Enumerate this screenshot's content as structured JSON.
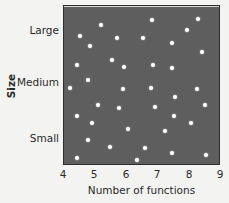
{
  "chart_data": {
    "type": "scatter",
    "title": "",
    "xlabel": "Number of functions",
    "ylabel": "Size",
    "xlim": [
      4,
      9
    ],
    "x_ticks": [
      "4",
      "5",
      "6",
      "7",
      "8",
      "9"
    ],
    "y_ticks": [
      "Small",
      "Medium",
      "Large"
    ],
    "y_axis_type": "categorical-ordinal",
    "grid": false,
    "legend": null,
    "colors": {
      "plot_background": "#5e5e5e",
      "points": "#ffffff",
      "page": "#f3f3f1"
    },
    "points": [
      {
        "x": 5.18,
        "y": 0.88
      },
      {
        "x": 6.8,
        "y": 0.91
      },
      {
        "x": 8.27,
        "y": 0.92
      },
      {
        "x": 4.51,
        "y": 0.81
      },
      {
        "x": 5.69,
        "y": 0.8
      },
      {
        "x": 6.52,
        "y": 0.8
      },
      {
        "x": 7.92,
        "y": 0.85
      },
      {
        "x": 4.83,
        "y": 0.75
      },
      {
        "x": 7.44,
        "y": 0.77
      },
      {
        "x": 8.39,
        "y": 0.71
      },
      {
        "x": 4.41,
        "y": 0.63
      },
      {
        "x": 5.53,
        "y": 0.66
      },
      {
        "x": 5.91,
        "y": 0.62
      },
      {
        "x": 6.83,
        "y": 0.63
      },
      {
        "x": 7.44,
        "y": 0.61
      },
      {
        "x": 4.76,
        "y": 0.54
      },
      {
        "x": 4.19,
        "y": 0.49
      },
      {
        "x": 5.88,
        "y": 0.48
      },
      {
        "x": 6.77,
        "y": 0.49
      },
      {
        "x": 8.24,
        "y": 0.48
      },
      {
        "x": 7.54,
        "y": 0.43
      },
      {
        "x": 5.08,
        "y": 0.38
      },
      {
        "x": 5.75,
        "y": 0.36
      },
      {
        "x": 6.9,
        "y": 0.37
      },
      {
        "x": 8.49,
        "y": 0.38
      },
      {
        "x": 4.41,
        "y": 0.31
      },
      {
        "x": 7.5,
        "y": 0.31
      },
      {
        "x": 4.89,
        "y": 0.27
      },
      {
        "x": 8.04,
        "y": 0.27
      },
      {
        "x": 6.04,
        "y": 0.23
      },
      {
        "x": 7.22,
        "y": 0.22
      },
      {
        "x": 4.76,
        "y": 0.16
      },
      {
        "x": 5.46,
        "y": 0.12
      },
      {
        "x": 6.58,
        "y": 0.11
      },
      {
        "x": 4.41,
        "y": 0.05
      },
      {
        "x": 6.32,
        "y": 0.04
      },
      {
        "x": 7.44,
        "y": 0.08
      },
      {
        "x": 8.52,
        "y": 0.07
      }
    ]
  },
  "labels": {
    "y_large": "Large",
    "y_medium": "Medium",
    "y_small": "Small",
    "x_axis": "Number of functions",
    "y_axis": "Size",
    "x4": "4",
    "x5": "5",
    "x6": "6",
    "x7": "7",
    "x8": "8",
    "x9": "9"
  }
}
